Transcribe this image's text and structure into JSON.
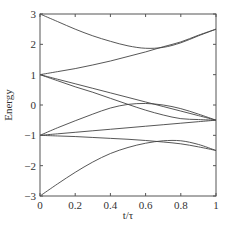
{
  "chart_data": {
    "type": "line",
    "title": "",
    "xlabel": "t/τ",
    "ylabel": "Energy",
    "xlim": [
      0,
      1
    ],
    "ylim": [
      -3,
      3
    ],
    "xticks": [
      "0",
      "0.2",
      "0.4",
      "0.6",
      "0.8",
      "1"
    ],
    "yticks": [
      "3",
      "2",
      "1",
      "0",
      "-1",
      "-2",
      "-3"
    ],
    "grid": false,
    "legend": null,
    "x": [
      0,
      0.1,
      0.2,
      0.3,
      0.4,
      0.5,
      0.6,
      0.7,
      0.8,
      0.9,
      1.0
    ],
    "series": [
      {
        "name": "level-1",
        "values": [
          3.0,
          2.75,
          2.5,
          2.28,
          2.1,
          1.95,
          1.87,
          1.9,
          2.05,
          2.28,
          2.5
        ]
      },
      {
        "name": "level-2",
        "values": [
          1.0,
          1.1,
          1.2,
          1.32,
          1.45,
          1.6,
          1.75,
          1.92,
          2.08,
          2.3,
          2.5
        ]
      },
      {
        "name": "level-3",
        "values": [
          1.0,
          0.85,
          0.7,
          0.55,
          0.4,
          0.25,
          0.1,
          -0.05,
          -0.2,
          -0.35,
          -0.5
        ]
      },
      {
        "name": "level-4",
        "values": [
          1.0,
          0.8,
          0.6,
          0.42,
          0.22,
          0.02,
          -0.17,
          -0.33,
          -0.45,
          -0.48,
          -0.5
        ]
      },
      {
        "name": "level-5",
        "values": [
          -1.0,
          -0.75,
          -0.52,
          -0.3,
          -0.1,
          0.02,
          0.05,
          0.0,
          -0.12,
          -0.3,
          -0.5
        ]
      },
      {
        "name": "level-6",
        "values": [
          -1.0,
          -0.95,
          -0.9,
          -0.85,
          -0.8,
          -0.75,
          -0.7,
          -0.65,
          -0.6,
          -0.55,
          -0.5
        ]
      },
      {
        "name": "level-7",
        "values": [
          -1.0,
          -1.02,
          -1.04,
          -1.07,
          -1.1,
          -1.13,
          -1.17,
          -1.22,
          -1.28,
          -1.38,
          -1.5
        ]
      },
      {
        "name": "level-8",
        "values": [
          -3.0,
          -2.6,
          -2.22,
          -1.88,
          -1.6,
          -1.4,
          -1.26,
          -1.18,
          -1.18,
          -1.3,
          -1.5
        ]
      }
    ]
  }
}
